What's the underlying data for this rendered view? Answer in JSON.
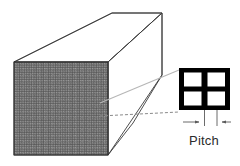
{
  "figure": {
    "type": "technical-line-diagram",
    "background_color": "#ffffff"
  },
  "block": {
    "name": "honeycomb-block",
    "description": "Rectangular extruded block drawn in oblique projection",
    "edge_color": "#3a3a3a",
    "face_fill_color": "#ffffff",
    "front_face": {
      "name": "honeycomb-front-face",
      "texture": "fine-square-cell-mesh",
      "texture_color_dark": "#4a4a4a",
      "texture_color_light": "#9a9a9a",
      "texture_base": "#7d7d7d",
      "cell_pitch_px": 2.4,
      "bounds": {
        "x": 14,
        "y": 62,
        "width": 94,
        "height": 93
      }
    },
    "top_face": {
      "name": "block-top-face",
      "points": "14,62 112,13 162,13 108,62"
    },
    "side_face": {
      "name": "block-side-face",
      "points": "108,62 162,13 162,75 133,123 108,155"
    }
  },
  "detail_callout": {
    "name": "magnified-cell-detail",
    "description": "Enlarged view of four honeycomb cells arranged 2x2",
    "wall_color": "#000000",
    "cell_fill_color": "#ffffff",
    "bounds": {
      "x": 179,
      "y": 68,
      "width": 51,
      "height": 42
    },
    "rows": 2,
    "columns": 2,
    "cell_count": 4,
    "wall_thickness_px": 5
  },
  "leader_lines": {
    "name": "callout-leader-lines",
    "solid_color": "#b6b6b6",
    "dashed_color": "#8a8a8a",
    "dash_pattern": "3 2",
    "lines": [
      {
        "name": "leader-line-upper",
        "style": "solid",
        "from_x": 100,
        "from_y": 103,
        "to_x": 179,
        "to_y": 70
      },
      {
        "name": "leader-line-lower",
        "style": "dashed",
        "from_x": 100,
        "from_y": 116,
        "to_x": 179,
        "to_y": 112
      }
    ]
  },
  "dimension": {
    "name": "pitch-dimension",
    "label": "Pitch",
    "line_color": "#5a5a5a",
    "arrow_color": "#5a5a5a",
    "extension_line_left_x": 204,
    "extension_line_right_x": 217,
    "baseline_y": 122,
    "label_position": {
      "x": 204,
      "y": 140
    },
    "left_arrow": {
      "from_x": 180,
      "from_y": 122,
      "to_x": 197,
      "to_y": 122,
      "direction": "right"
    },
    "right_arrow": {
      "from_x": 226,
      "from_y": 122,
      "to_x": 214,
      "to_y": 122,
      "direction": "left"
    }
  }
}
